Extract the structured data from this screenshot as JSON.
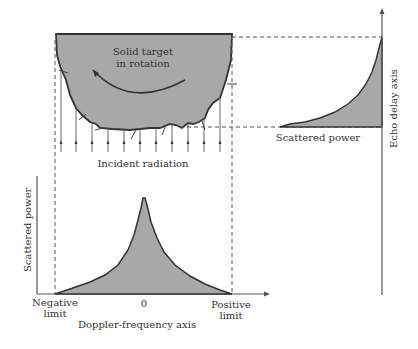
{
  "target": {
    "label_line1": "Solid target",
    "label_line2": "in rotation",
    "fill_color": "#a8a8a8",
    "outline_color": "#333333"
  },
  "incident": {
    "label": "Incident radiation",
    "ray_count": 11
  },
  "delay_plot": {
    "axis_label": "Echo delay axis",
    "curve_label": "Scattered power"
  },
  "doppler_plot": {
    "y_axis_label": "Scattered power",
    "x_axis_label": "Doppler-frequency axis",
    "negative_limit_line1": "Negative",
    "negative_limit_line2": "limit",
    "zero_label": "0",
    "positive_limit_line1": "Positive",
    "positive_limit_line2": "limit"
  },
  "colors": {
    "fill": "#a8a8a8",
    "line": "#333333",
    "dash": "#555555"
  }
}
